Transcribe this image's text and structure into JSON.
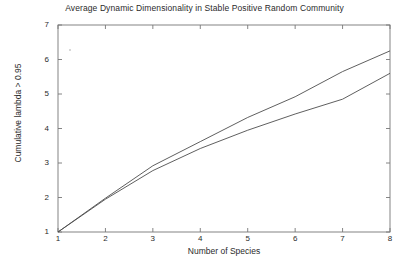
{
  "chart_data": {
    "type": "line",
    "title": "Average Dynamic Dimensionality in Stable Positive Random Community",
    "xlabel": "Number of Species",
    "ylabel": "Cumulative lambda > 0.95",
    "xlim": [
      1,
      8
    ],
    "ylim": [
      1,
      7
    ],
    "xticks": [
      1,
      2,
      3,
      4,
      5,
      6,
      7,
      8
    ],
    "yticks": [
      1,
      2,
      3,
      4,
      5,
      6,
      7
    ],
    "grid": false,
    "legend": "none",
    "x": [
      1,
      2,
      3,
      4,
      5,
      6,
      7,
      8
    ],
    "series": [
      {
        "name": "upper",
        "color": "#4d4d4d",
        "values": [
          1.0,
          1.98,
          2.92,
          3.62,
          4.32,
          4.92,
          5.65,
          6.25
        ]
      },
      {
        "name": "lower",
        "color": "#4d4d4d",
        "values": [
          1.0,
          1.95,
          2.78,
          3.42,
          3.95,
          4.42,
          4.85,
          5.6
        ]
      }
    ]
  },
  "axis": {
    "xtick_labels": [
      "1",
      "2",
      "3",
      "4",
      "5",
      "6",
      "7",
      "8"
    ],
    "ytick_labels": [
      "1",
      "2",
      "3",
      "4",
      "5",
      "6",
      "7"
    ]
  }
}
